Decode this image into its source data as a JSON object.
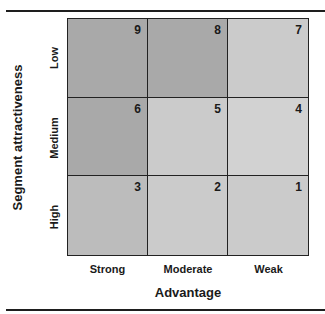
{
  "diagram": {
    "y_axis_title": "Segment attractiveness",
    "x_axis_title": "Advantage",
    "row_labels": [
      "Low",
      "Medium",
      "High"
    ],
    "column_labels": [
      "Strong",
      "Moderate",
      "Weak"
    ],
    "cells": [
      {
        "row": "Low",
        "column": "Strong",
        "value": "9",
        "shade": "#a9a9a9"
      },
      {
        "row": "Low",
        "column": "Moderate",
        "value": "8",
        "shade": "#a9a9a9"
      },
      {
        "row": "Low",
        "column": "Weak",
        "value": "7",
        "shade": "#cbcbcb"
      },
      {
        "row": "Medium",
        "column": "Strong",
        "value": "6",
        "shade": "#a9a9a9"
      },
      {
        "row": "Medium",
        "column": "Moderate",
        "value": "5",
        "shade": "#cbcbcb"
      },
      {
        "row": "Medium",
        "column": "Weak",
        "value": "4",
        "shade": "#d2d2d2"
      },
      {
        "row": "High",
        "column": "Strong",
        "value": "3",
        "shade": "#bcbcbc"
      },
      {
        "row": "High",
        "column": "Moderate",
        "value": "2",
        "shade": "#cbcbcb"
      },
      {
        "row": "High",
        "column": "Weak",
        "value": "1",
        "shade": "#cbcbcb"
      }
    ]
  }
}
